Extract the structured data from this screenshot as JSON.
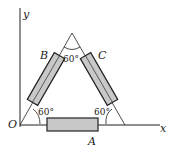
{
  "diagram": {
    "axes": {
      "x_label": "x",
      "y_label": "y",
      "origin_label": "O"
    },
    "blocks": [
      {
        "label": "A",
        "position": "base"
      },
      {
        "label": "B",
        "position": "left side"
      },
      {
        "label": "C",
        "position": "right side"
      }
    ],
    "angles": {
      "apex": "60°",
      "bottom_left": "60°",
      "bottom_right": "60°"
    },
    "colors": {
      "block_fill": "#c8c8c8",
      "line": "#222222"
    }
  }
}
